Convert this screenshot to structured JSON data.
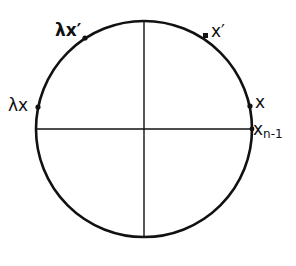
{
  "diagram": {
    "type": "unit circle with axes",
    "colors": {
      "stroke": "#111111",
      "background": "#ffffff"
    },
    "circle": {
      "cx": 144,
      "cy": 129,
      "r": 108
    },
    "points": [
      {
        "id": "lambda-x-prime",
        "label": "λx′",
        "angle_deg": 123
      },
      {
        "id": "x-prime",
        "label": "x′",
        "angle_deg": 57
      },
      {
        "id": "x",
        "label": "x",
        "angle_deg": 11
      },
      {
        "id": "x-n-minus-1",
        "label_main": "x",
        "label_sub": "n-1",
        "angle_deg": 0
      },
      {
        "id": "lambda-x",
        "label": "λx",
        "angle_deg": 168
      }
    ]
  }
}
